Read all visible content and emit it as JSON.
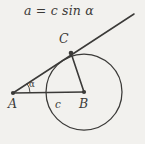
{
  "figure": {
    "title_formula": "a = c sin α",
    "background_color": "#f2f1ee",
    "ink_color": "#3b3a38",
    "labels": {
      "vertex_a": "A",
      "vertex_b": "B",
      "vertex_c": "C",
      "side_c": "c",
      "angle_alpha": "α"
    },
    "geometry": {
      "point_a": {
        "x": 13,
        "y": 93
      },
      "point_b": {
        "x": 84,
        "y": 92
      },
      "point_c": {
        "x": 71,
        "y": 53
      },
      "tangent_end": {
        "x": 134,
        "y": 14
      },
      "circle": {
        "cx": 84,
        "cy": 92,
        "r": 38
      },
      "angle_arc_radius": 17
    }
  }
}
